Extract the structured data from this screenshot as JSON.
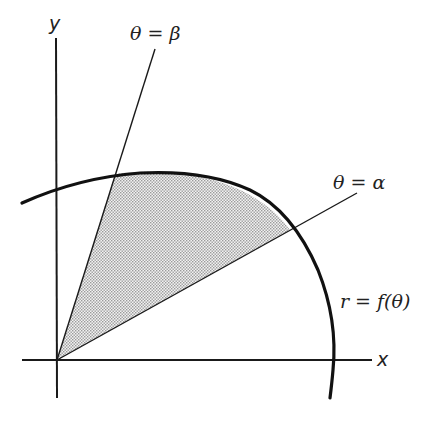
{
  "diagram": {
    "labels": {
      "y_axis": "y",
      "x_axis": "x",
      "ray_beta": "θ = β",
      "ray_alpha": "θ = α",
      "curve": "r = f(θ)"
    },
    "colors": {
      "stroke": "#1a1a1a",
      "shade": "#c8c8c8",
      "background": "#ffffff"
    },
    "geometry": {
      "origin": [
        57,
        360
      ],
      "x_axis_end": [
        372,
        360
      ],
      "x_axis_start": [
        22,
        360
      ],
      "y_axis_top": [
        55,
        38
      ],
      "y_axis_bottom": [
        57,
        398
      ],
      "beta_ray_end": [
        155,
        49
      ],
      "alpha_ray_end": [
        357,
        193
      ],
      "beta_intersection": [
        115,
        174
      ],
      "alpha_intersection": [
        290,
        230
      ]
    }
  }
}
